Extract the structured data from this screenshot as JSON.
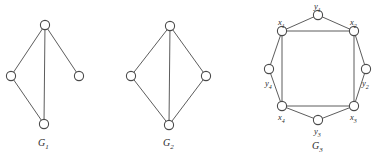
{
  "figure": {
    "background_color": "#ffffff",
    "stroke_color": "#4a4a4a",
    "vertex_fill": "#ffffff",
    "text_color": "#2b2b2b",
    "width": 379,
    "height": 157
  },
  "graphs": [
    {
      "id": "G1",
      "caption_letter": "G",
      "caption_sub": "1",
      "caption_x": 38,
      "caption_y": 138,
      "vertices": [
        {
          "name": "top",
          "x": 45,
          "y": 25,
          "r": 4.6
        },
        {
          "name": "left",
          "x": 11,
          "y": 76,
          "r": 4.6
        },
        {
          "name": "right",
          "x": 79,
          "y": 76,
          "r": 4.6
        },
        {
          "name": "bottom",
          "x": 44,
          "y": 124,
          "r": 4.6
        }
      ],
      "edges": [
        {
          "from": "top",
          "to": "left"
        },
        {
          "from": "top",
          "to": "right"
        },
        {
          "from": "top",
          "to": "bottom"
        },
        {
          "from": "left",
          "to": "bottom"
        }
      ]
    },
    {
      "id": "G2",
      "caption_letter": "G",
      "caption_sub": "2",
      "caption_x": 163,
      "caption_y": 138,
      "vertices": [
        {
          "name": "top",
          "x": 170,
          "y": 26,
          "r": 4.6
        },
        {
          "name": "left",
          "x": 131,
          "y": 76,
          "r": 4.6
        },
        {
          "name": "right",
          "x": 206,
          "y": 76,
          "r": 4.6
        },
        {
          "name": "bottom",
          "x": 169,
          "y": 125,
          "r": 4.6
        }
      ],
      "edges": [
        {
          "from": "top",
          "to": "left"
        },
        {
          "from": "top",
          "to": "right"
        },
        {
          "from": "top",
          "to": "bottom"
        },
        {
          "from": "left",
          "to": "bottom"
        },
        {
          "from": "right",
          "to": "bottom"
        }
      ]
    },
    {
      "id": "G3",
      "caption_letter": "G",
      "caption_sub": "3",
      "caption_x": 312,
      "caption_y": 141,
      "vertices": [
        {
          "name": "y1",
          "label_letter": "y",
          "label_sub": "1",
          "x": 318,
          "y": 15,
          "r": 4.6,
          "label_x": 314,
          "label_y": 2
        },
        {
          "name": "x2",
          "label_letter": "x",
          "label_sub": "2",
          "x": 354,
          "y": 31,
          "r": 4.6,
          "label_x": 350,
          "label_y": 18
        },
        {
          "name": "y2",
          "label_letter": "y",
          "label_sub": "2",
          "x": 366,
          "y": 69,
          "r": 4.6,
          "label_x": 362,
          "label_y": 79
        },
        {
          "name": "x3",
          "label_letter": "x",
          "label_sub": "3",
          "x": 354,
          "y": 106,
          "r": 4.6,
          "label_x": 350,
          "label_y": 113
        },
        {
          "name": "y3",
          "label_letter": "y",
          "label_sub": "3",
          "x": 318,
          "y": 120,
          "r": 4.6,
          "label_x": 314,
          "label_y": 127
        },
        {
          "name": "x4",
          "label_letter": "x",
          "label_sub": "4",
          "x": 282,
          "y": 106,
          "r": 4.6,
          "label_x": 278,
          "label_y": 113
        },
        {
          "name": "y4",
          "label_letter": "y",
          "label_sub": "4",
          "x": 269,
          "y": 69,
          "r": 4.6,
          "label_x": 265,
          "label_y": 79
        },
        {
          "name": "x1",
          "label_letter": "x",
          "label_sub": "1",
          "x": 282,
          "y": 31,
          "r": 4.6,
          "label_x": 278,
          "label_y": 18
        }
      ],
      "edges": [
        {
          "from": "y1",
          "to": "x2"
        },
        {
          "from": "x2",
          "to": "y2"
        },
        {
          "from": "y2",
          "to": "x3"
        },
        {
          "from": "x3",
          "to": "y3"
        },
        {
          "from": "y3",
          "to": "x4"
        },
        {
          "from": "x4",
          "to": "y4"
        },
        {
          "from": "y4",
          "to": "x1"
        },
        {
          "from": "x1",
          "to": "y1"
        },
        {
          "from": "x1",
          "to": "x2"
        },
        {
          "from": "x2",
          "to": "x3"
        },
        {
          "from": "x3",
          "to": "x4"
        },
        {
          "from": "x4",
          "to": "x1"
        }
      ]
    }
  ]
}
